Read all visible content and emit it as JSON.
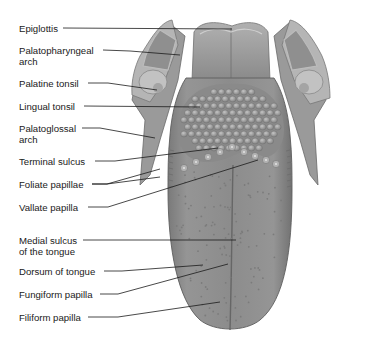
{
  "diagram": {
    "labels": [
      {
        "id": "epiglottis",
        "text": "Epiglottis",
        "line2": ""
      },
      {
        "id": "palatopharyngeal-arch",
        "text": "Palatopharyngeal",
        "line2": "arch"
      },
      {
        "id": "palatine-tonsil",
        "text": "Palatine tonsil",
        "line2": ""
      },
      {
        "id": "lingual-tonsil",
        "text": "Lingual tonsil",
        "line2": ""
      },
      {
        "id": "palatoglossal-arch",
        "text": "Palatoglossal",
        "line2": "arch"
      },
      {
        "id": "terminal-sulcus",
        "text": "Terminal sulcus",
        "line2": ""
      },
      {
        "id": "foliate-papillae",
        "text": "Foliate papillae",
        "line2": ""
      },
      {
        "id": "vallate-papilla",
        "text": "Vallate papilla",
        "line2": ""
      },
      {
        "id": "medial-sulcus",
        "text": "Medial sulcus",
        "line2": "of the tongue"
      },
      {
        "id": "dorsum-of-tongue",
        "text": "Dorsum of tongue",
        "line2": ""
      },
      {
        "id": "fungiform-papilla",
        "text": "Fungiform papilla",
        "line2": ""
      },
      {
        "id": "filiform-papilla",
        "text": "Filiform papilla",
        "line2": ""
      }
    ],
    "colors": {
      "tongue": "#8e8e8e",
      "tongue_dark": "#6e6e6e",
      "tonsil": "#a9a9a9",
      "line": "#1a1a1a",
      "text": "#1a1a1a"
    }
  }
}
